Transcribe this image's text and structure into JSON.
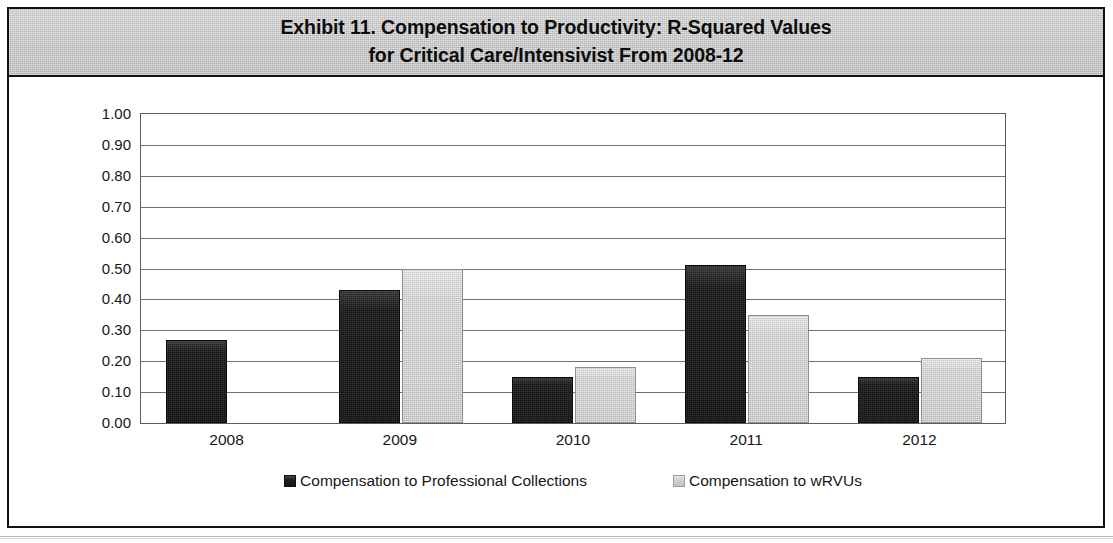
{
  "exhibit": {
    "title_line1": "Exhibit 11. Compensation to Productivity: R-Squared Values",
    "title_line2": "for Critical Care/Intensivist From 2008-12"
  },
  "colors": {
    "title_band": "#c6c6c6",
    "series_dark": "#1d1d1d",
    "series_light": "#cdcdcd",
    "gridline": "#707070",
    "frame": "#111111"
  },
  "chart_data": {
    "type": "bar",
    "title": "Exhibit 11. Compensation to Productivity: R-Squared Values for Critical Care/Intensivist From 2008-12",
    "xlabel": "",
    "ylabel": "",
    "categories": [
      "2008",
      "2009",
      "2010",
      "2011",
      "2012"
    ],
    "series": [
      {
        "name": "Compensation to Professional Collections",
        "color": "#1d1d1d",
        "values": [
          0.27,
          0.43,
          0.15,
          0.51,
          0.15
        ]
      },
      {
        "name": "Compensation to wRVUs",
        "color": "#cdcdcd",
        "values": [
          0.0,
          0.5,
          0.18,
          0.35,
          0.21
        ]
      }
    ],
    "ylim": [
      0.0,
      1.0
    ],
    "ytick_step": 0.1,
    "ytick_labels": [
      "1.00",
      "0.90",
      "0.80",
      "0.70",
      "0.60",
      "0.50",
      "0.40",
      "0.30",
      "0.20",
      "0.10",
      "0.00"
    ],
    "grid": true,
    "legend_position": "bottom"
  }
}
